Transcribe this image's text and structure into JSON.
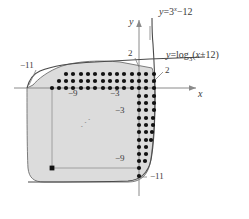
{
  "figure": {
    "kind": "cartesian-graph-with-lattice-points",
    "background": "#ffffff",
    "axes": {
      "x_axis_label": "x",
      "y_axis_label": "y",
      "axis_color": "#8a8a8a",
      "origin_px": [
        139,
        88
      ],
      "unit_px": 7.3
    },
    "curves": [
      {
        "name": "exponential",
        "label": "y=3",
        "label_exponent": "x",
        "label_tail": "−12",
        "color": "#4a4a4a",
        "equation": "y = 3^x - 12"
      },
      {
        "name": "logarithmic",
        "label": "y=log",
        "label_base": "3",
        "label_tail": "(x+12)",
        "color": "#4a4a4a",
        "equation": "y = log_3(x + 12)"
      }
    ],
    "tick_labels": [
      {
        "text": "−11",
        "axis": "x",
        "value": -11,
        "pos_px": [
          20,
          66
        ]
      },
      {
        "text": "−9",
        "axis": "x",
        "value": -9,
        "pos_px": [
          72,
          92
        ]
      },
      {
        "text": "−3",
        "axis": "x",
        "value": -3,
        "pos_px": [
          113,
          92
        ]
      },
      {
        "text": "2",
        "axis": "y",
        "value": 2,
        "pos_px": [
          128,
          53
        ]
      },
      {
        "text": "2",
        "axis": "x",
        "value": 2,
        "pos_px": [
          164,
          72
        ]
      },
      {
        "text": "−3",
        "axis": "y",
        "value": -3,
        "pos_px": [
          118,
          110
        ]
      },
      {
        "text": "−9",
        "axis": "y",
        "value": -9,
        "pos_px": [
          118,
          158
        ]
      },
      {
        "text": "−11",
        "axis": "y",
        "value": -11,
        "pos_px": [
          148,
          177
        ]
      }
    ],
    "region": {
      "fill": "#dcdcdc",
      "stroke": "#6e6e6e",
      "description": "shaded region bounded by the two curves"
    },
    "lattice": {
      "dot_color": "#111111",
      "dot_radius_px": 2.1,
      "description": "integer lattice points inside the region near its boundary"
    },
    "ellipsis": {
      "text": "⋰",
      "pos_px": [
        84,
        124
      ]
    }
  }
}
